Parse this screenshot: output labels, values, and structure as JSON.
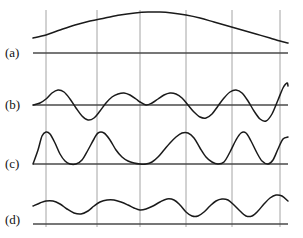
{
  "figure": {
    "kind": "multi-panel-waveform-plot",
    "background_color": "#ffffff",
    "curve_color": "#1a1a1a",
    "gridline_color": "#9a9a9a",
    "baseline_color": "#4a4a4a",
    "width": 303,
    "height": 238,
    "plot_left": 33,
    "plot_right": 288,
    "gridlines_x": [
      46,
      97,
      140,
      186,
      232,
      280
    ]
  },
  "panels": [
    {
      "id": "a",
      "label": "(a)",
      "label_x": 5,
      "label_y": 45,
      "baseline_y": 53,
      "axis_x_start": 33,
      "axis_x_end": 288,
      "curve_color": "#1a1a1a",
      "description": "Broad single smooth arch (lowest-frequency envelope component), peaking near centre of the span."
    },
    {
      "id": "b",
      "label": "(b)",
      "label_x": 5,
      "label_y": 97,
      "baseline_y": 105,
      "axis_x_start": 33,
      "axis_x_end": 288,
      "curve_color": "#1a1a1a",
      "description": "Oscillatory waveform crossing the baseline repeatedly, amplitude growing toward the right end."
    },
    {
      "id": "c",
      "label": "(c)",
      "label_x": 5,
      "label_y": 156,
      "baseline_y": 164,
      "axis_x_start": 33,
      "axis_x_end": 288,
      "curve_color": "#1a1a1a",
      "description": "Rectified-looking positive-only waveform with sharp lobes touching the baseline between peaks."
    },
    {
      "id": "d",
      "label": "(d)",
      "label_x": 5,
      "label_y": 212,
      "baseline_y": 224,
      "axis_x_start": 33,
      "axis_x_end": 288,
      "curve_color": "#1a1a1a",
      "description": "Low-amplitude undulating curve riding above the baseline with gentle repeated humps."
    }
  ],
  "chart_data": {
    "type": "line",
    "title": "",
    "xlabel": "",
    "ylabel": "",
    "grid": true,
    "legend_position": "none",
    "axis_ranges": {
      "x": [
        33,
        288
      ]
    },
    "gridlines_x": [
      46,
      97,
      140,
      186,
      232,
      280
    ],
    "series": [
      {
        "name": "(a)",
        "baseline_y": 53,
        "points": [
          [
            33,
            38
          ],
          [
            46,
            35
          ],
          [
            60,
            30
          ],
          [
            75,
            25
          ],
          [
            90,
            21
          ],
          [
            105,
            18
          ],
          [
            120,
            15
          ],
          [
            135,
            13
          ],
          [
            148,
            12
          ],
          [
            160,
            12
          ],
          [
            172,
            13
          ],
          [
            186,
            15
          ],
          [
            200,
            18
          ],
          [
            214,
            22
          ],
          [
            228,
            26
          ],
          [
            242,
            30
          ],
          [
            256,
            34
          ],
          [
            270,
            38
          ],
          [
            280,
            41
          ],
          [
            288,
            43
          ]
        ]
      },
      {
        "name": "(b)",
        "baseline_y": 105,
        "points": [
          [
            33,
            105
          ],
          [
            40,
            103
          ],
          [
            46,
            99
          ],
          [
            52,
            93
          ],
          [
            58,
            90
          ],
          [
            64,
            92
          ],
          [
            70,
            99
          ],
          [
            76,
            108
          ],
          [
            82,
            116
          ],
          [
            88,
            120
          ],
          [
            94,
            118
          ],
          [
            100,
            111
          ],
          [
            106,
            103
          ],
          [
            112,
            97
          ],
          [
            118,
            94
          ],
          [
            124,
            93
          ],
          [
            130,
            95
          ],
          [
            136,
            99
          ],
          [
            140,
            102
          ],
          [
            146,
            105
          ],
          [
            152,
            103
          ],
          [
            158,
            99
          ],
          [
            164,
            95
          ],
          [
            170,
            93
          ],
          [
            176,
            94
          ],
          [
            182,
            98
          ],
          [
            188,
            105
          ],
          [
            194,
            112
          ],
          [
            200,
            117
          ],
          [
            206,
            118
          ],
          [
            212,
            114
          ],
          [
            218,
            106
          ],
          [
            224,
            98
          ],
          [
            230,
            92
          ],
          [
            236,
            90
          ],
          [
            242,
            93
          ],
          [
            248,
            101
          ],
          [
            254,
            111
          ],
          [
            260,
            119
          ],
          [
            266,
            121
          ],
          [
            272,
            114
          ],
          [
            278,
            100
          ],
          [
            283,
            88
          ],
          [
            287,
            83
          ],
          [
            288,
            86
          ]
        ]
      },
      {
        "name": "(c)",
        "baseline_y": 164,
        "points": [
          [
            33,
            164
          ],
          [
            38,
            150
          ],
          [
            42,
            136
          ],
          [
            46,
            132
          ],
          [
            50,
            134
          ],
          [
            55,
            143
          ],
          [
            60,
            154
          ],
          [
            65,
            161
          ],
          [
            70,
            164
          ],
          [
            76,
            164
          ],
          [
            82,
            160
          ],
          [
            88,
            150
          ],
          [
            94,
            139
          ],
          [
            98,
            133
          ],
          [
            104,
            133
          ],
          [
            110,
            140
          ],
          [
            116,
            150
          ],
          [
            122,
            157
          ],
          [
            128,
            161
          ],
          [
            134,
            163
          ],
          [
            140,
            164
          ],
          [
            146,
            164
          ],
          [
            152,
            162
          ],
          [
            158,
            157
          ],
          [
            164,
            150
          ],
          [
            170,
            143
          ],
          [
            176,
            137
          ],
          [
            182,
            133
          ],
          [
            188,
            133
          ],
          [
            194,
            138
          ],
          [
            200,
            148
          ],
          [
            206,
            157
          ],
          [
            212,
            162
          ],
          [
            218,
            164
          ],
          [
            224,
            162
          ],
          [
            230,
            152
          ],
          [
            236,
            140
          ],
          [
            241,
            133
          ],
          [
            246,
            133
          ],
          [
            251,
            141
          ],
          [
            257,
            153
          ],
          [
            262,
            161
          ],
          [
            268,
            164
          ],
          [
            273,
            160
          ],
          [
            278,
            149
          ],
          [
            283,
            139
          ],
          [
            288,
            137
          ]
        ]
      },
      {
        "name": "(d)",
        "baseline_y": 224,
        "points": [
          [
            33,
            206
          ],
          [
            40,
            203
          ],
          [
            46,
            201
          ],
          [
            53,
            201
          ],
          [
            60,
            204
          ],
          [
            67,
            209
          ],
          [
            74,
            213
          ],
          [
            81,
            214
          ],
          [
            88,
            211
          ],
          [
            94,
            206
          ],
          [
            100,
            202
          ],
          [
            107,
            200
          ],
          [
            114,
            200
          ],
          [
            121,
            202
          ],
          [
            128,
            205
          ],
          [
            134,
            208
          ],
          [
            140,
            210
          ],
          [
            146,
            209
          ],
          [
            153,
            206
          ],
          [
            160,
            202
          ],
          [
            167,
            199
          ],
          [
            174,
            200
          ],
          [
            180,
            205
          ],
          [
            186,
            212
          ],
          [
            192,
            216
          ],
          [
            198,
            216
          ],
          [
            204,
            212
          ],
          [
            210,
            206
          ],
          [
            216,
            201
          ],
          [
            222,
            199
          ],
          [
            228,
            200
          ],
          [
            234,
            205
          ],
          [
            240,
            211
          ],
          [
            246,
            216
          ],
          [
            252,
            216
          ],
          [
            258,
            211
          ],
          [
            264,
            204
          ],
          [
            270,
            198
          ],
          [
            276,
            195
          ],
          [
            282,
            196
          ],
          [
            288,
            201
          ]
        ]
      }
    ]
  }
}
